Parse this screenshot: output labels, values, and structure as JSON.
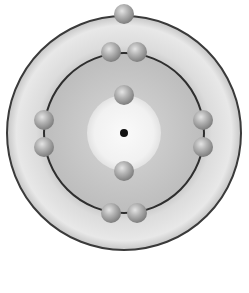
{
  "diagram": {
    "center": {
      "x": 124,
      "y": 133
    },
    "outer_shell": {
      "radius": 117,
      "fill_light": "#e6e6e6",
      "fill_dark": "#b8b8b8",
      "stroke": "#3a3a3a"
    },
    "inner_orbit": {
      "radius": 80,
      "fill": "#c8c8c8",
      "stroke": "#2e2e2e"
    },
    "core_region": {
      "radius": 37,
      "fill": "#f4f4f4"
    },
    "nucleus": {
      "radius": 4,
      "fill": "#111111"
    },
    "electron_radius": 10,
    "electron_color": "#a8a8a8",
    "shells": [
      {
        "name": "shell-1",
        "electron_count": 2,
        "electrons": [
          {
            "x": 124,
            "y": 95
          },
          {
            "x": 124,
            "y": 171
          }
        ]
      },
      {
        "name": "shell-2",
        "electron_count": 8,
        "electrons": [
          {
            "x": 111,
            "y": 52
          },
          {
            "x": 137,
            "y": 52
          },
          {
            "x": 44,
            "y": 120
          },
          {
            "x": 44,
            "y": 147
          },
          {
            "x": 203,
            "y": 120
          },
          {
            "x": 203,
            "y": 147
          },
          {
            "x": 111,
            "y": 213
          },
          {
            "x": 137,
            "y": 213
          }
        ]
      },
      {
        "name": "shell-3",
        "electron_count": 1,
        "electrons": [
          {
            "x": 124,
            "y": 14
          }
        ]
      }
    ]
  }
}
